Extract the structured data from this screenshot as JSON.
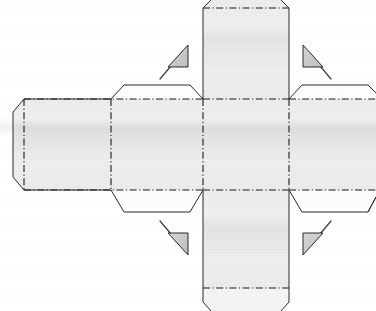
{
  "document": {
    "title": "Cube Net Papercraft Template",
    "kind": "cube-net-diagram",
    "width": 376,
    "height": 311,
    "background_color": "#ffffff"
  },
  "style": {
    "panel_fill": "#e9e9e9",
    "panel_fill_light": "#efefef",
    "tab_fill": "#ffffff",
    "cut_line_color": "#2b2b2b",
    "fold_line_color": "#1a1a1a",
    "arrow_fill": "#c9c9c9",
    "arrow_stroke": "#2b2b2b",
    "fold_dash_pattern": "7 2.5 1.2 2.5"
  },
  "geometry": {
    "center_x": 246,
    "center_y": 144.5,
    "cell": 86,
    "left_fold_x": 203,
    "right_fold_x": 289,
    "top_fold_y": 99,
    "bottom_fold_y": 190
  },
  "panels": [
    {
      "name": "center-face",
      "label": "Center face",
      "shape": "square",
      "fill": "#e9e9e9",
      "points": "203,99 289,99 289,190 203,190",
      "folds": [
        "203,99 289,99",
        "203,190 289,190",
        "203,99 203,190",
        "289,99 289,190"
      ]
    },
    {
      "name": "top-face",
      "label": "Top face with chamfered flap",
      "shape": "chamfered-rect",
      "fill": "#e9e9e9",
      "points": "203,99 203,8 211,0 281,0 289,8 289,99",
      "folds": [
        "203,99 289,99"
      ],
      "cuts": [
        "203,99 203,8 211,0",
        "281,0 289,8 289,99"
      ]
    },
    {
      "name": "bottom-face",
      "label": "Bottom face",
      "shape": "rect",
      "fill": "#e9e9e9",
      "points": "203,190 289,190 289,288 203,288",
      "folds": [
        "203,190 289,190",
        "203,288 289,288"
      ],
      "cuts": [
        "203,190 203,288",
        "289,190 289,288"
      ]
    },
    {
      "name": "bottom-glue-flap",
      "label": "Bottom glue flap",
      "shape": "chamfered-trapezoid",
      "fill": "#ffffff",
      "points": "203,288 289,288 289,302 281,311 211,311 203,302",
      "folds": [
        "203,288 289,288"
      ],
      "cuts": [
        "203,288 203,302 211,311 281,311 289,302 289,288"
      ]
    },
    {
      "name": "left-face",
      "label": "Left face",
      "shape": "rect",
      "fill": "#e9e9e9",
      "points": "111,99 203,99 203,190 111,190",
      "folds": [
        "111,99 111,190",
        "203,99 203,190",
        "111,99 203,99",
        "111,190 203,190"
      ]
    },
    {
      "name": "left-top-tab",
      "label": "Left face upper glue tab",
      "shape": "trapezoid",
      "fill": "#ffffff",
      "points": "111,99 124,85 190,85 203,99",
      "folds": [
        "111,99 203,99"
      ],
      "cuts": [
        "111,99 124,85 190,85 203,99"
      ]
    },
    {
      "name": "left-bottom-tab",
      "label": "Left face lower glue tab",
      "shape": "trapezoid",
      "fill": "#ffffff",
      "points": "111,190 203,190 190,212 124,212",
      "folds": [
        "111,190 203,190"
      ],
      "cuts": [
        "111,190 124,212 190,212 203,190"
      ]
    },
    {
      "name": "far-left-face",
      "label": "Far-left face with chamfered edge",
      "shape": "chamfered-rect",
      "fill": "#e9e9e9",
      "points": "111,99 24,99 13,112 13,177 24,190 111,190",
      "folds": [
        "111,99 111,190",
        "24,99 24,190"
      ],
      "cuts": [
        "111,99 24,99 13,112 13,177 24,190 111,190"
      ]
    },
    {
      "name": "right-face",
      "label": "Right face",
      "shape": "rect",
      "fill": "#e9e9e9",
      "points": "289,99 376,99 376,190 289,190",
      "folds": [
        "289,99 289,190",
        "289,99 376,99",
        "289,190 376,190"
      ]
    },
    {
      "name": "right-top-tab",
      "label": "Right face upper glue tab",
      "shape": "trapezoid",
      "fill": "#ffffff",
      "points": "289,99 302,85 368,85 376,93",
      "folds": [
        "289,99 376,99"
      ],
      "cuts": [
        "289,99 302,85 368,85 376,93"
      ]
    },
    {
      "name": "right-bottom-tab",
      "label": "Right face lower glue tab",
      "shape": "trapezoid",
      "fill": "#ffffff",
      "points": "289,190 376,190 376,197 368,212 302,212",
      "folds": [
        "289,190 376,190"
      ],
      "cuts": [
        "289,190 302,212 368,212 376,197"
      ]
    }
  ],
  "arrows": [
    {
      "name": "fold-arrow-top-left",
      "direction": "up-right",
      "tail": "160,79",
      "tip": "187,48",
      "head_points": "187,45 187,65 170,65",
      "fill": "#c9c9c9"
    },
    {
      "name": "fold-arrow-top-right",
      "direction": "up-left",
      "tail": "331,79",
      "tip": "304,48",
      "head_points": "304,45 304,65 321,65",
      "fill": "#c9c9c9"
    },
    {
      "name": "fold-arrow-bottom-left",
      "direction": "down-right",
      "tail": "160,221",
      "tip": "187,252",
      "head_points": "187,255 187,235 170,235",
      "fill": "#c9c9c9"
    },
    {
      "name": "fold-arrow-bottom-right",
      "direction": "down-left",
      "tail": "331,221",
      "tip": "304,252",
      "head_points": "304,255 304,235 321,235",
      "fill": "#c9c9c9"
    }
  ],
  "legend": {
    "fold_line_meaning": "fold (dash-dot)",
    "cut_line_meaning": "cut (solid)",
    "arrow_meaning": "fold direction toward center"
  }
}
